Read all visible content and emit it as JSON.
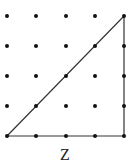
{
  "figure": {
    "label": "Z",
    "grid": {
      "cols": 5,
      "rows": 5,
      "x": [
        7,
        36,
        66,
        95,
        124
      ],
      "y": [
        16,
        46,
        76,
        106,
        136
      ]
    },
    "triangle": [
      [
        7,
        136
      ],
      [
        124,
        16
      ],
      [
        124,
        136
      ]
    ],
    "colors": {
      "dot": "#111111",
      "line": "#333333"
    }
  }
}
